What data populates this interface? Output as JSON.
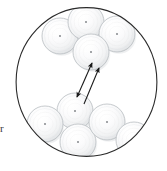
{
  "figure": {
    "background_color": "#ffffff",
    "width": 167,
    "height": 171
  },
  "field_circle": {
    "name": "field-of-view-circle",
    "center_x": 86.5,
    "center_y": 82,
    "radius_x": 71,
    "radius_y": 75,
    "stroke_color": "#2b2b2b",
    "stroke_width": 1.1,
    "fill_color": "#ffffff"
  },
  "sphere_style": {
    "outline_color": "#b8bcc0",
    "outline_width": 0.8,
    "highlight_color": "#ffffff",
    "mid_color": "#f4f5f6",
    "edge_color": "#d4d7da",
    "shadow_color": "#c9ccd0",
    "center_dot_color": "#8d9094",
    "center_dot_radius": 1.1
  },
  "spheres": [
    {
      "id": "sphere-top-left",
      "cx": 60,
      "cy": 36,
      "r": 18
    },
    {
      "id": "sphere-top-center",
      "cx": 86,
      "cy": 22,
      "r": 18
    },
    {
      "id": "sphere-top-right",
      "cx": 117,
      "cy": 34,
      "r": 18
    },
    {
      "id": "sphere-middle-probe",
      "cx": 91,
      "cy": 52,
      "r": 18
    },
    {
      "id": "sphere-lower-probe",
      "cx": 75,
      "cy": 111,
      "r": 18
    },
    {
      "id": "sphere-bottom-left",
      "cx": 45,
      "cy": 124,
      "r": 18
    },
    {
      "id": "sphere-bottom-center",
      "cx": 78,
      "cy": 142,
      "r": 18
    },
    {
      "id": "sphere-bottom-right",
      "cx": 107,
      "cy": 122,
      "r": 18
    },
    {
      "id": "sphere-bottom-far-right",
      "cx": 134,
      "cy": 140,
      "r": 18
    }
  ],
  "arrows": [
    {
      "id": "arrow-double-headed",
      "x1": 92,
      "y1": 63,
      "x2": 77,
      "y2": 97,
      "head_start": true,
      "head_end": true,
      "color": "#1a1a1a",
      "width": 1.1
    },
    {
      "id": "arrow-single-headed",
      "x1": 84,
      "y1": 104,
      "x2": 99,
      "y2": 68,
      "head_start": false,
      "head_end": true,
      "color": "#1a1a1a",
      "width": 1.1
    }
  ],
  "edge_mark": {
    "name": "left-edge-tick",
    "text": "r",
    "left": 0,
    "top": 123,
    "color": "#3a3a3a"
  }
}
